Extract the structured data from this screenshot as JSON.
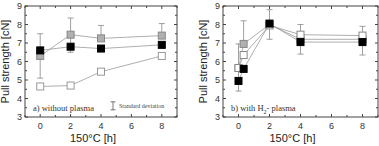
{
  "chart_data": [
    {
      "id": "a",
      "type": "line",
      "title": "a) without plasma",
      "annotation": "a) without plasma",
      "legend_note": "Standard deviation",
      "xlabel": "150°C   [h]",
      "ylabel": "Pull strength [cN]",
      "xlim": [
        -1,
        9
      ],
      "ylim": [
        3,
        9
      ],
      "xticks": [
        0,
        2,
        4,
        6,
        8
      ],
      "yticks": [
        3,
        4,
        5,
        6,
        7,
        8,
        9
      ],
      "grid": false,
      "series": [
        {
          "name": "grey",
          "marker": "square",
          "fill": "#b0b0b0",
          "stroke": "#888888",
          "x": [
            0,
            2,
            4,
            8
          ],
          "y": [
            6.3,
            7.45,
            7.25,
            7.4
          ],
          "err_low": [
            5.1,
            6.5,
            null,
            null
          ],
          "err_high": [
            7.5,
            8.35,
            7.95,
            8.05
          ]
        },
        {
          "name": "black",
          "marker": "square",
          "fill": "#000000",
          "stroke": "#000000",
          "x": [
            0,
            2,
            4,
            8
          ],
          "y": [
            6.6,
            6.8,
            6.7,
            6.9
          ],
          "err_low": [
            null,
            null,
            null,
            null
          ],
          "err_high": [
            null,
            null,
            null,
            null
          ]
        },
        {
          "name": "white",
          "marker": "square",
          "fill": "#ffffff",
          "stroke": "#999999",
          "x": [
            0,
            2,
            4,
            8
          ],
          "y": [
            4.65,
            4.7,
            5.45,
            6.3
          ],
          "err_low": [
            null,
            null,
            null,
            null
          ],
          "err_high": [
            null,
            null,
            null,
            null
          ]
        }
      ]
    },
    {
      "id": "b",
      "type": "line",
      "title": "b) with H2- plasma",
      "annotation": "b) with H",
      "annotation_sub": "2",
      "annotation_tail": "- plasma",
      "xlabel": "150°C   [h]",
      "ylabel": "Pull strength [cN]",
      "xlim": [
        -1,
        9
      ],
      "ylim": [
        3,
        9
      ],
      "xticks": [
        0,
        2,
        4,
        6,
        8
      ],
      "yticks": [
        3,
        4,
        5,
        6,
        7,
        8,
        9
      ],
      "grid": false,
      "series": [
        {
          "name": "grey",
          "marker": "square",
          "fill": "#b0b0b0",
          "stroke": "#888888",
          "x": [
            0,
            0.33,
            2,
            4,
            8
          ],
          "y": [
            5.65,
            6.95,
            8.0,
            7.2,
            7.2
          ],
          "err_low": [
            4.4,
            null,
            7.2,
            6.4,
            6.35
          ],
          "err_high": [
            6.95,
            8.2,
            8.8,
            8.0,
            7.9
          ]
        },
        {
          "name": "white",
          "marker": "square",
          "fill": "#ffffff",
          "stroke": "#888888",
          "x": [
            0,
            0.33,
            2,
            4,
            8
          ],
          "y": [
            5.65,
            6.35,
            7.95,
            7.45,
            7.4
          ],
          "err_low": [
            null,
            null,
            null,
            null,
            null
          ],
          "err_high": [
            null,
            null,
            null,
            null,
            null
          ]
        },
        {
          "name": "black",
          "marker": "square",
          "fill": "#000000",
          "stroke": "#000000",
          "x": [
            0,
            0.33,
            2,
            4,
            8
          ],
          "y": [
            4.95,
            5.6,
            8.05,
            7.05,
            7.05
          ],
          "err_low": [
            null,
            null,
            null,
            null,
            null
          ],
          "err_high": [
            null,
            null,
            null,
            null,
            null
          ]
        }
      ]
    }
  ]
}
